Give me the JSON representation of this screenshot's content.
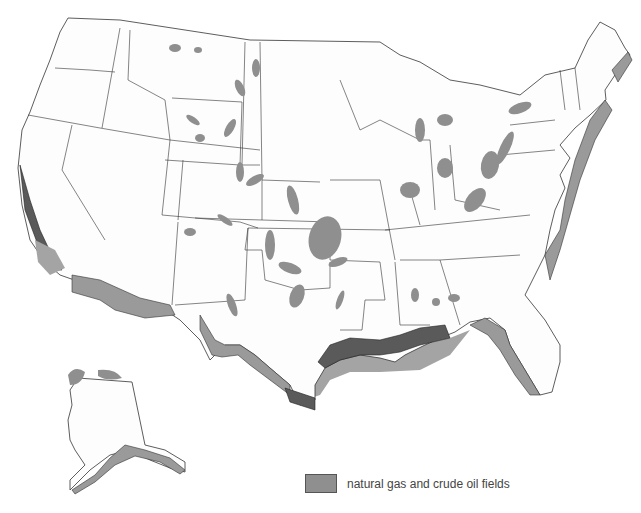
{
  "map": {
    "title": "",
    "region": "United States",
    "legend": {
      "items": [
        {
          "label": "natural gas and crude oil fields",
          "color": "#8f8f8f"
        }
      ]
    },
    "colors": {
      "land": "#fdfdfd",
      "field": "#8f8f8f",
      "offshore_shelf": "#9a9a9a",
      "offshore_dark": "#5a5a5a",
      "border": "#333333"
    },
    "insets": [
      "Alaska"
    ]
  }
}
